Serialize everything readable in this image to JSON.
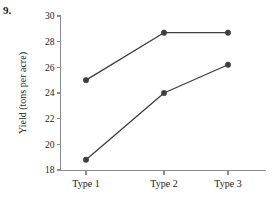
{
  "figure": {
    "number_label": "9."
  },
  "chart_data": {
    "type": "line",
    "title": "",
    "subtitle": "",
    "xlabel": "",
    "ylabel": "Yield (tons per acre)",
    "categories": [
      "Type 1",
      "Type 2",
      "Type 3"
    ],
    "ylim": [
      18,
      30
    ],
    "ytick_labels": [
      "18",
      "20",
      "22",
      "24",
      "26",
      "28",
      "30"
    ],
    "yticks": [
      18,
      20,
      22,
      24,
      26,
      28,
      30
    ],
    "grid": false,
    "legend": "none",
    "marker": "filled-circle",
    "line_color": "#3d3d42",
    "axis_color": "#8c8c8c",
    "series": [
      {
        "name": "upper",
        "values": [
          25.0,
          28.7,
          28.7
        ]
      },
      {
        "name": "lower",
        "values": [
          18.8,
          24.0,
          26.2
        ]
      }
    ]
  }
}
